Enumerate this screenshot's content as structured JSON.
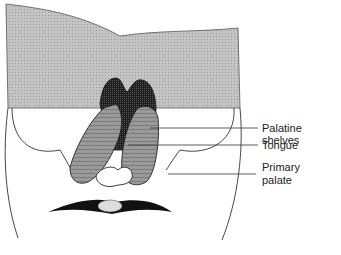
{
  "figure": {
    "labels": [
      {
        "id": "palatine-shelves",
        "text": "Palatine shelves"
      },
      {
        "id": "tongue",
        "text": "Tongue"
      },
      {
        "id": "primary-palate-1",
        "text": "Primary"
      },
      {
        "id": "primary-palate-2",
        "text": "palate"
      }
    ]
  },
  "colors": {
    "cut-surface": "#b8b8b8",
    "line": "#333333",
    "shelf-dark": "#2a2a2a",
    "tissue": "#8a8a8a"
  }
}
